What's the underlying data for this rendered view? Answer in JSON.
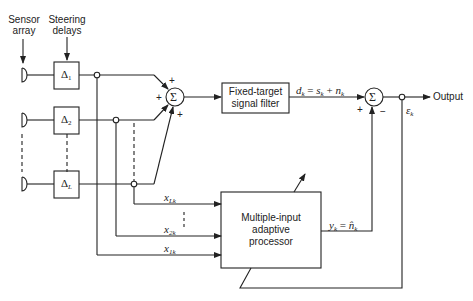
{
  "diagram": {
    "labels": {
      "sensor_array": [
        "Sensor",
        "array"
      ],
      "steering_delays": [
        "Steering",
        "delays"
      ],
      "output": "Output"
    },
    "delays": [
      {
        "sym": "Δ",
        "sub": "1"
      },
      {
        "sym": "Δ",
        "sub": "2"
      },
      {
        "sym": "Δ",
        "sub": "L"
      }
    ],
    "summer_symbol": "Σ",
    "summer1_signs": [
      "+",
      "+",
      "+"
    ],
    "summer2_signs": {
      "plus": "+",
      "minus": "−"
    },
    "filter_box": [
      "Fixed-target",
      "signal filter"
    ],
    "processor_box": [
      "Multiple-input",
      "adaptive",
      "processor"
    ],
    "signals": {
      "dk": {
        "main": "d",
        "sub": "k",
        "eq": " = ",
        "s": "s",
        "s_sub": "k",
        "plus": " + ",
        "n": "n",
        "n_sub": "k"
      },
      "yk": {
        "main": "y",
        "sub": "k",
        "eq": " = ",
        "n_hat": "n̂",
        "n_sub": "k"
      },
      "ek": {
        "main": "ε",
        "sub": "k"
      },
      "inputs": [
        {
          "main": "x",
          "sub": "Lk"
        },
        {
          "main": "x",
          "sub": "2k"
        },
        {
          "main": "x",
          "sub": "1k"
        }
      ]
    }
  }
}
